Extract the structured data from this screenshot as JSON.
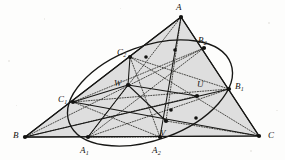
{
  "figure": {
    "type": "geometry-diagram",
    "background_color": "#fdfdfc",
    "fill_color": "#dedede",
    "stroke_color": "#1a1a18",
    "vertices": {
      "A": {
        "x": 181,
        "y": 17
      },
      "B": {
        "x": 25,
        "y": 137
      },
      "C": {
        "x": 259,
        "y": 136
      }
    },
    "points": [
      {
        "name": "A",
        "label": "A",
        "x": 181,
        "y": 17,
        "lx": 176,
        "ly": 3,
        "dot": true
      },
      {
        "name": "B",
        "label": "B",
        "x": 25,
        "y": 137,
        "lx": 13,
        "ly": 131,
        "dot": true
      },
      {
        "name": "C",
        "label": "C",
        "x": 259,
        "y": 136,
        "lx": 268,
        "ly": 131,
        "dot": true
      },
      {
        "name": "A1",
        "label": "A",
        "sub": "1",
        "x": 88,
        "y": 137,
        "lx": 80,
        "ly": 146,
        "dot": true
      },
      {
        "name": "A2",
        "label": "A",
        "sub": "2",
        "x": 160,
        "y": 137,
        "lx": 152,
        "ly": 146,
        "dot": true
      },
      {
        "name": "B1",
        "label": "B",
        "sub": "1",
        "x": 229,
        "y": 89,
        "lx": 235,
        "ly": 82,
        "dot": true
      },
      {
        "name": "B2",
        "label": "B",
        "sub": "2",
        "x": 204,
        "y": 48,
        "lx": 198,
        "ly": 36,
        "dot": true
      },
      {
        "name": "C1",
        "label": "C",
        "sub": "1",
        "x": 73,
        "y": 102,
        "lx": 58,
        "ly": 95,
        "dot": true
      },
      {
        "name": "C2",
        "label": "C",
        "sub": "2",
        "x": 130,
        "y": 57,
        "lx": 117,
        "ly": 48,
        "dot": true
      },
      {
        "name": "U",
        "label": "U",
        "x": 197,
        "y": 96,
        "lx": 197,
        "ly": 80,
        "dot": true
      },
      {
        "name": "V",
        "label": "V",
        "x": 166,
        "y": 121,
        "lx": 160,
        "ly": 129,
        "dot": true
      },
      {
        "name": "W",
        "label": "W",
        "x": 128,
        "y": 85,
        "lx": 114,
        "ly": 79,
        "dot": true
      }
    ],
    "unlabeled_nodes": [
      {
        "x": 171,
        "y": 110
      },
      {
        "x": 196,
        "y": 118
      },
      {
        "x": 146,
        "y": 57
      },
      {
        "x": 175,
        "y": 50
      }
    ],
    "conic": {
      "type": "ellipse",
      "cx": 150,
      "cy": 93,
      "rx": 86,
      "ry": 47,
      "rotation": -20,
      "passes_through": [
        "A1",
        "A2",
        "B1",
        "B2",
        "C1",
        "C2"
      ]
    },
    "solid_segments": [
      [
        "A",
        "B"
      ],
      [
        "B",
        "C"
      ],
      [
        "C",
        "A"
      ],
      [
        "A",
        "A2"
      ],
      [
        "B",
        "B1"
      ],
      [
        "C",
        "C1"
      ],
      [
        "W",
        "U"
      ],
      [
        "W",
        "V"
      ],
      [
        "W",
        "C2"
      ],
      [
        "W",
        "A1"
      ],
      [
        "W",
        "C1"
      ]
    ],
    "dotted_segments": [
      [
        "A",
        "A1"
      ],
      [
        "B",
        "B2"
      ],
      [
        "C",
        "C2"
      ],
      [
        "C1",
        "B2"
      ],
      [
        "C2",
        "B1"
      ],
      [
        "A1",
        "B2"
      ],
      [
        "A2",
        "C2"
      ],
      [
        "C1",
        "A2"
      ],
      [
        "A1",
        "B1"
      ],
      [
        "B",
        "U"
      ],
      [
        "C",
        "V"
      ],
      [
        "A",
        "V"
      ],
      [
        "C1",
        "B1"
      ],
      [
        "A1",
        "A2"
      ]
    ]
  }
}
